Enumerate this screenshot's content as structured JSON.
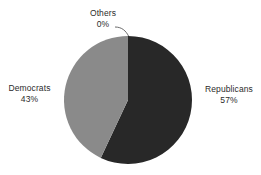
{
  "chart_data": {
    "type": "pie",
    "title": "",
    "subtitle": "",
    "xlabel": "",
    "ylabel": "",
    "legend_position": "none",
    "grid": false,
    "labels_outside": true,
    "categories": [
      "Republicans",
      "Democrats",
      "Others"
    ],
    "values": [
      57,
      43,
      0
    ],
    "value_unit": "%",
    "start_angle_deg": 0,
    "direction": "clockwise",
    "slices": [
      {
        "name": "Republicans",
        "value": 57,
        "value_label": "57%",
        "color": "#282828",
        "start_angle_deg": 0,
        "end_angle_deg": 205.2,
        "label_position": "right",
        "has_leader_line": false
      },
      {
        "name": "Democrats",
        "value": 43,
        "value_label": "43%",
        "color": "#8a8a8a",
        "start_angle_deg": 205.2,
        "end_angle_deg": 360,
        "label_position": "left",
        "has_leader_line": false
      },
      {
        "name": "Others",
        "value": 0,
        "value_label": "0%",
        "color": "#c8c8c8",
        "start_angle_deg": 360,
        "end_angle_deg": 360,
        "label_position": "top",
        "has_leader_line": true
      }
    ]
  },
  "colors": {
    "background": "#ffffff",
    "text": "#2b2b2b",
    "republicans": "#282828",
    "democrats": "#8a8a8a",
    "leader_line": "#5a5a5a"
  },
  "labels": {
    "republicans": {
      "name": "Republicans",
      "value": "57%"
    },
    "democrats": {
      "name": "Democrats",
      "value": "43%"
    },
    "others": {
      "name": "Others",
      "value": "0%"
    }
  }
}
